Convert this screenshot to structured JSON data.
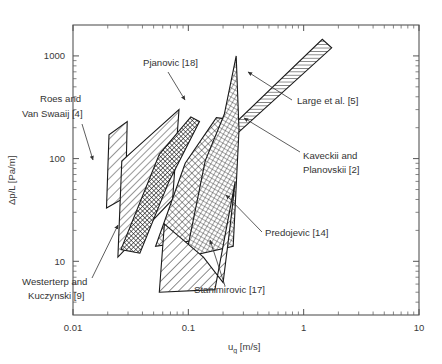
{
  "chart_data": {
    "type": "area",
    "title": "",
    "xlabel": "u_g [m/s]",
    "xlabel_main": "u",
    "xlabel_sub": "g",
    "xlabel_unit": "[m/s]",
    "ylabel": "Δp/L [Pa/m]",
    "xscale": "log",
    "yscale": "log",
    "xlim": [
      0.01,
      10
    ],
    "ylim": [
      3,
      2000
    ],
    "grid": false,
    "legend_position": "inline-annotations",
    "x_tick_labels": [
      "0.01",
      "0.1",
      "1",
      "10"
    ],
    "x_tick_values": [
      0.01,
      0.1,
      1,
      10
    ],
    "y_tick_labels": [
      "10",
      "100",
      "1000"
    ],
    "y_tick_values": [
      10,
      100,
      1000
    ],
    "series": [
      {
        "name": "Roes and Van Swaaij [4]",
        "label": "Roes and\nVan Swaaij [4]",
        "line1": "Roes and",
        "line2": "Van Swaaij [4]",
        "reference": "[4]",
        "hatch": "diagonal-sparse",
        "polygon_xy": [
          [
            0.0195,
            33
          ],
          [
            0.0205,
            170
          ],
          [
            0.0295,
            230
          ],
          [
            0.0285,
            42
          ]
        ],
        "x_range": [
          0.0195,
          0.0295
        ],
        "y_range": [
          33,
          230
        ]
      },
      {
        "name": "Westerterp and Kuczynski [9]",
        "label": "Westerterp and\nKuczynski [9]",
        "line1": "Westerterp and",
        "line2": "Kuczynski [9]",
        "reference": "[9]",
        "hatch": "diagonal-medium",
        "polygon_xy": [
          [
            0.0245,
            11
          ],
          [
            0.0265,
            95
          ],
          [
            0.083,
            300
          ],
          [
            0.073,
            40
          ]
        ],
        "x_range": [
          0.0245,
          0.083
        ],
        "y_range": [
          11,
          300
        ]
      },
      {
        "name": "Pjanovic [18]",
        "label": "Pjanovic [18]",
        "line1": "Pjanovic [18]",
        "reference": "[18]",
        "hatch": "cross-dense",
        "polygon_xy": [
          [
            0.026,
            13
          ],
          [
            0.056,
            110
          ],
          [
            0.105,
            255
          ],
          [
            0.125,
            230
          ],
          [
            0.068,
            60
          ],
          [
            0.038,
            12
          ]
        ],
        "x_range": [
          0.026,
          0.125
        ],
        "y_range": [
          12,
          255
        ]
      },
      {
        "name": "Kaveckii and Planovskii [2]",
        "label": "Kaveckii and\nPlanovskii [2]",
        "line1": "Kaveckii and",
        "line2": "Planovskii [2]",
        "reference": "[2]",
        "hatch": "cross-medium",
        "polygon_xy": [
          [
            0.052,
            14
          ],
          [
            0.094,
            90
          ],
          [
            0.175,
            250
          ],
          [
            0.235,
            240
          ],
          [
            0.215,
            60
          ],
          [
            0.115,
            16
          ]
        ],
        "x_range": [
          0.052,
          0.235
        ],
        "y_range": [
          14,
          250
        ]
      },
      {
        "name": "Large et al. [5]",
        "label": "Large et al. [5]",
        "line1": "Large et al. [5]",
        "reference": "[5]",
        "hatch": "horizontal",
        "polygon_xy": [
          [
            0.175,
            115
          ],
          [
            0.205,
            175
          ],
          [
            1.45,
            1450
          ],
          [
            1.75,
            1200
          ]
        ],
        "x_range": [
          0.175,
          1.75
        ],
        "y_range": [
          115,
          1450
        ]
      },
      {
        "name": "Predojevic [14]",
        "label": "Predojevic [14]",
        "line1": "Predojevic [14]",
        "reference": "[14]",
        "hatch": "cross-fine",
        "polygon_xy": [
          [
            0.095,
            11
          ],
          [
            0.14,
            95
          ],
          [
            0.205,
            270
          ],
          [
            0.26,
            1000
          ],
          [
            0.275,
            190
          ],
          [
            0.245,
            14
          ]
        ],
        "x_range": [
          0.095,
          0.275
        ],
        "y_range": [
          11,
          1000
        ]
      },
      {
        "name": "Stanimirovic [17]",
        "label": "Stanimirovic [17]",
        "line1": "Stanimirovic [17]",
        "reference": "[17]",
        "hatch": "diagonal-wide",
        "polygon_xy": [
          [
            0.056,
            5.0
          ],
          [
            0.062,
            23
          ],
          [
            0.135,
            11
          ],
          [
            0.2,
            6.2
          ],
          [
            0.23,
            22
          ],
          [
            0.255,
            60
          ],
          [
            0.17,
            5.3
          ]
        ],
        "x_range": [
          0.056,
          0.255
        ],
        "y_range": [
          5.0,
          60
        ]
      }
    ],
    "annotations": [
      {
        "text": "Pjanovic [18]",
        "x": 143,
        "y": 66
      },
      {
        "text": "Roes and",
        "x": 40,
        "y": 102
      },
      {
        "text": "Van Swaaij [4]",
        "x": 22,
        "y": 117
      },
      {
        "text": "Large et al. [5]",
        "x": 297,
        "y": 104
      },
      {
        "text": "Kaveckii and",
        "x": 303,
        "y": 159
      },
      {
        "text": "Planovskii [2]",
        "x": 303,
        "y": 173
      },
      {
        "text": "Predojevic [14]",
        "x": 265,
        "y": 236
      },
      {
        "text": "Westerterp and",
        "x": 22,
        "y": 285
      },
      {
        "text": "Kuczynski [9]",
        "x": 28,
        "y": 299
      },
      {
        "text": "Stanimirovic [17]",
        "x": 194,
        "y": 293
      }
    ]
  },
  "figure": {
    "caption_partial": ""
  }
}
